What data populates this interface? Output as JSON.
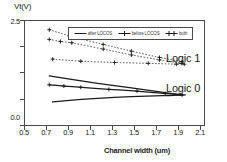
{
  "chart_data": {
    "type": "line",
    "title": "",
    "xlabel": "Channel width  (um)",
    "ylabel": "Vt(V)",
    "xlim": [
      0.5,
      2.1
    ],
    "ylim": [
      0.0,
      2.5
    ],
    "xticks": [
      "0.5",
      "0.7",
      "0.9",
      "1.1",
      "1.3",
      "1.5",
      "1.7",
      "1.9",
      "2.1"
    ],
    "yticks": [
      "0.0",
      "2.5"
    ],
    "grid": false,
    "legend_position": "top-center-inside",
    "annotations": [
      {
        "text": "Logic 1",
        "x": 1.72,
        "y": 1.45
      },
      {
        "text": "Logic 0",
        "x": 1.72,
        "y": 0.8
      }
    ],
    "series": [
      {
        "name": "after LOCOS",
        "group": "Logic 1",
        "style": "dotted",
        "marker": "plus",
        "x": [
          0.72,
          0.9,
          1.2,
          1.45,
          1.7,
          1.9
        ],
        "y": [
          2.28,
          2.13,
          1.93,
          1.77,
          1.62,
          1.52
        ]
      },
      {
        "name": "before LOCOS",
        "group": "Logic 1",
        "style": "dotted",
        "marker": "plus",
        "x": [
          0.72,
          0.82,
          0.92,
          1.2,
          1.45,
          1.7,
          1.9
        ],
        "y": [
          2.05,
          2.0,
          1.97,
          1.82,
          1.68,
          1.56,
          1.48
        ]
      },
      {
        "name": "both",
        "group": "Logic 1",
        "style": "dotted",
        "marker": "plus",
        "x": [
          0.75,
          1.0,
          1.3,
          1.6,
          1.85,
          1.92
        ],
        "y": [
          1.58,
          1.53,
          1.5,
          1.48,
          1.46,
          1.46
        ]
      },
      {
        "name": "after LOCOS",
        "group": "Logic 0",
        "style": "solid",
        "marker": "none",
        "x": [
          0.72,
          1.0,
          1.3,
          1.6,
          1.9
        ],
        "y": [
          1.18,
          1.06,
          0.95,
          0.84,
          0.73
        ]
      },
      {
        "name": "before LOCOS",
        "group": "Logic 0",
        "style": "solid",
        "marker": "plus",
        "x": [
          0.72,
          0.85,
          1.0,
          1.25,
          1.5,
          1.75,
          1.9
        ],
        "y": [
          0.97,
          0.94,
          0.91,
          0.86,
          0.82,
          0.76,
          0.73
        ]
      },
      {
        "name": "both",
        "group": "Logic 0",
        "style": "solid",
        "marker": "none",
        "x": [
          0.75,
          1.0,
          1.3,
          1.6,
          1.85,
          1.93
        ],
        "y": [
          0.56,
          0.62,
          0.67,
          0.7,
          0.72,
          0.73
        ]
      }
    ]
  },
  "legend": {
    "entries": [
      {
        "label": "after LOCOS",
        "style": "solid-plain"
      },
      {
        "label": "before LOCOS",
        "style": "solid-plus"
      },
      {
        "label": "both",
        "style": "solid-double-plus"
      }
    ]
  },
  "axes": {
    "y_title": "Vt(V)",
    "x_title": "Channel width  (um)",
    "y_tick_top": "2.5",
    "y_tick_bottom": "0.0",
    "x_tick_labels": [
      "0.5",
      "0.7",
      "0.9",
      "1.1",
      "1.3",
      "1.5",
      "1.7",
      "1.9",
      "2.1"
    ]
  },
  "annotations": {
    "logic1": "Logic 1",
    "logic0": "Logic 0"
  },
  "colors": {
    "ink": "#1a1a1a",
    "frame": "#4a4a4a",
    "background": "#ffffff"
  }
}
